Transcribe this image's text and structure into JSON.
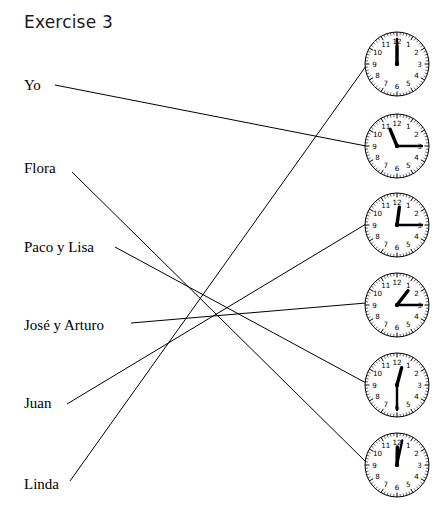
{
  "worksheet": {
    "title": "Exercise 3",
    "type": "matching-exercise",
    "background_color": "#ffffff",
    "line_color": "#000000",
    "text_color": "#000000"
  },
  "labels": [
    {
      "id": "yo",
      "text": "Yo",
      "x": 24,
      "y": 85,
      "anchor_x": 55,
      "anchor_y": 85
    },
    {
      "id": "flora",
      "text": "Flora",
      "x": 24,
      "y": 168,
      "anchor_x": 72,
      "anchor_y": 172
    },
    {
      "id": "paco-y-lisa",
      "text": "Paco y Lisa",
      "x": 24,
      "y": 247,
      "anchor_x": 115,
      "anchor_y": 247
    },
    {
      "id": "jose-y-arturo",
      "text": "José y Arturo",
      "x": 24,
      "y": 325,
      "anchor_x": 131,
      "anchor_y": 323
    },
    {
      "id": "juan",
      "text": "Juan",
      "x": 24,
      "y": 403,
      "anchor_x": 67,
      "anchor_y": 404
    },
    {
      "id": "linda",
      "text": "Linda",
      "x": 24,
      "y": 484,
      "anchor_x": 70,
      "anchor_y": 481
    }
  ],
  "clocks": [
    {
      "id": "clock-1",
      "cx": 397,
      "cy": 64,
      "r": 32,
      "hour": 12,
      "minute": 0,
      "time_label": "12:00"
    },
    {
      "id": "clock-2",
      "cx": 397,
      "cy": 146,
      "r": 32,
      "hour": 11,
      "minute": 15,
      "time_label": "11:15"
    },
    {
      "id": "clock-3",
      "cx": 397,
      "cy": 225,
      "r": 32,
      "hour": 12,
      "minute": 15,
      "time_label": "12:15"
    },
    {
      "id": "clock-4",
      "cx": 397,
      "cy": 305,
      "r": 32,
      "hour": 1,
      "minute": 15,
      "time_label": "1:15"
    },
    {
      "id": "clock-5",
      "cx": 397,
      "cy": 385,
      "r": 32,
      "hour": 12,
      "minute": 30,
      "time_label": "12:30"
    },
    {
      "id": "clock-6",
      "cx": 397,
      "cy": 465,
      "r": 32,
      "hour": 12,
      "minute": 2,
      "time_label": "12:00"
    },
    {
      "id": "clock-7",
      "cx": 397,
      "cy": 545,
      "r": 32,
      "hour": 12,
      "minute": 0,
      "time_label": "12:00"
    }
  ],
  "clock_numerals": [
    "1",
    "2",
    "3",
    "4",
    "5",
    "6",
    "7",
    "8",
    "9",
    "10",
    "11",
    "12"
  ],
  "connections": [
    {
      "from": "yo",
      "to": "clock-2",
      "x1": 55,
      "y1": 85,
      "x2": 366,
      "y2": 146
    },
    {
      "from": "flora",
      "to": "clock-6",
      "x1": 72,
      "y1": 172,
      "x2": 366,
      "y2": 462
    },
    {
      "from": "paco-y-lisa",
      "to": "clock-5",
      "x1": 115,
      "y1": 247,
      "x2": 366,
      "y2": 383
    },
    {
      "from": "jose-y-arturo",
      "to": "clock-4",
      "x1": 131,
      "y1": 323,
      "x2": 366,
      "y2": 303
    },
    {
      "from": "juan",
      "to": "clock-3",
      "x1": 67,
      "y1": 404,
      "x2": 366,
      "y2": 224
    },
    {
      "from": "linda",
      "to": "clock-1",
      "x1": 70,
      "y1": 481,
      "x2": 366,
      "y2": 66
    }
  ]
}
